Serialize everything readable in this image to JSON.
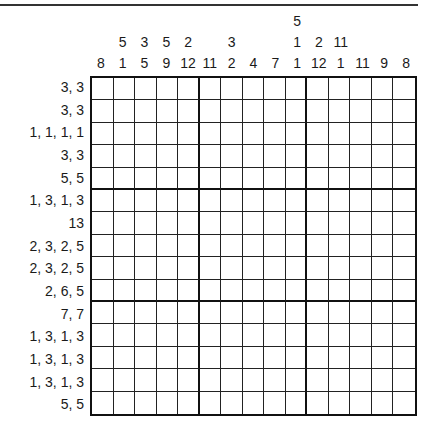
{
  "puzzle": {
    "type": "nonogram",
    "size": {
      "rows": 15,
      "cols": 15
    },
    "column_clues": [
      [
        "8"
      ],
      [
        "5",
        "1"
      ],
      [
        "3",
        "5"
      ],
      [
        "5",
        "9"
      ],
      [
        "2",
        "12"
      ],
      [
        "11"
      ],
      [
        "3",
        "2"
      ],
      [
        "4"
      ],
      [
        "7"
      ],
      [
        "5",
        "1",
        "1"
      ],
      [
        "2",
        "12"
      ],
      [
        "11",
        "1"
      ],
      [
        "11"
      ],
      [
        "9"
      ],
      [
        "8"
      ]
    ],
    "row_clues": [
      "3, 3",
      "3, 3",
      "1, 1, 1, 1",
      "3, 3",
      "5, 5",
      "1, 3, 1, 3",
      "13",
      "2, 3, 2, 5",
      "2, 3, 2, 5",
      "2, 6, 5",
      "7, 7",
      "1, 3, 1, 3",
      "1, 3, 1, 3",
      "1, 3, 1, 3",
      "5, 5"
    ],
    "filled_cells": []
  }
}
